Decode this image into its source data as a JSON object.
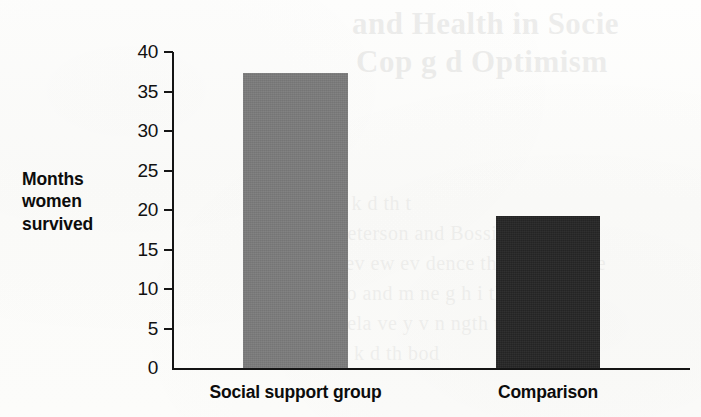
{
  "figure": {
    "background_color": "#fdfdfb",
    "ink_color": "#141414"
  },
  "chart_data": {
    "type": "bar",
    "title": "",
    "xlabel": "",
    "ylabel": "Months women survived",
    "categories": [
      "Social support group",
      "Comparison"
    ],
    "values": [
      37.3,
      19.3
    ],
    "bar_colors": [
      "#7c7c7c",
      "#262626"
    ],
    "ylim": [
      0,
      40
    ],
    "yticks": [
      0,
      5,
      10,
      15,
      20,
      25,
      30,
      35,
      40
    ],
    "ytick_labels": [
      "0",
      "5",
      "10",
      "15",
      "20",
      "25",
      "30",
      "35",
      "40"
    ],
    "grid": false,
    "legend": false,
    "legend_position": "none",
    "annotations": []
  },
  "axis": {
    "label_line_1": "Months",
    "label_line_2": "women",
    "label_line_3": "survived"
  },
  "ghost_text": {
    "line_1": "and Health in Socie",
    "line_2": "Cop g d Optimism",
    "line_3": "t k d th t",
    "line_4": "Peterson and Bossio 1991 h",
    "line_5": "rev ew ev dence that ope  Cance",
    "line_6": "bo  and m ne   g  h i  th  i d",
    "line_7": "rela ve y v n  ngth  tw n g",
    "line_8": "h  k  d th  bod"
  }
}
